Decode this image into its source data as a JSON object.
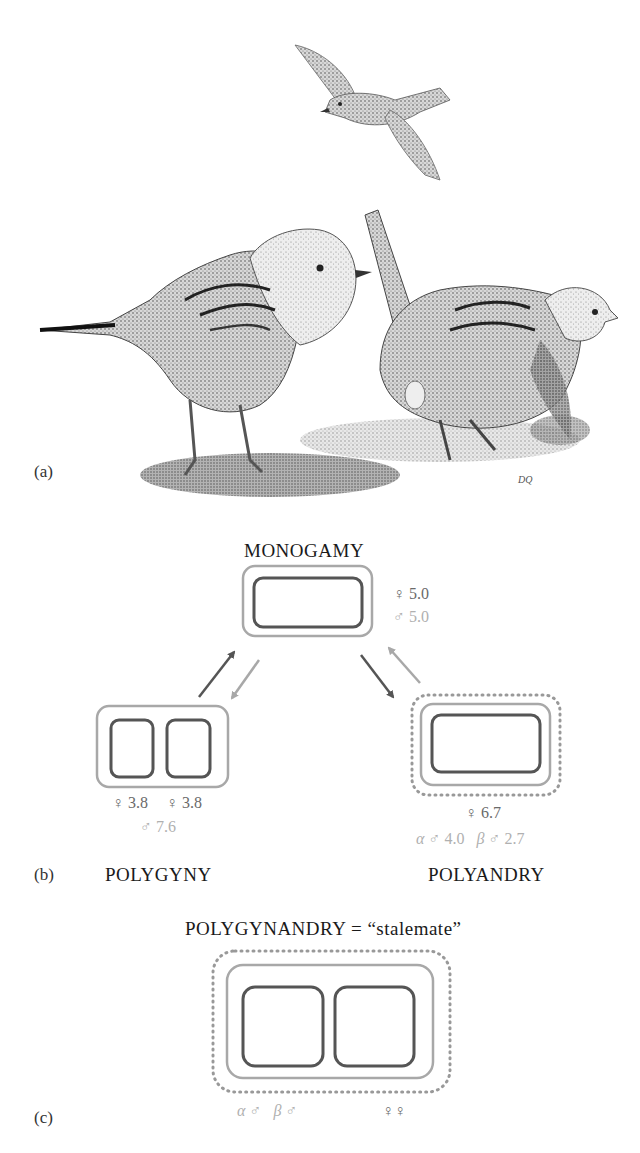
{
  "panels": {
    "a": {
      "label": "(a)",
      "illustration": "three-dunnocks-stipple-drawing",
      "artist_mark": "DQ"
    },
    "b": {
      "label": "(b)",
      "monogamy": {
        "title": "MONOGAMY",
        "female": "♀ 5.0",
        "male": "♂ 5.0"
      },
      "polygyny": {
        "title": "POLYGYNY",
        "female_1": "♀ 3.8",
        "female_2": "♀ 3.8",
        "male": "♂ 7.6"
      },
      "polyandry": {
        "title": "POLYANDRY",
        "female": "♀ 6.7",
        "alpha_symbol": "α",
        "alpha_male": "♂ 4.0",
        "beta_symbol": "β",
        "beta_male": "♂ 2.7"
      }
    },
    "c": {
      "label": "(c)",
      "title": "POLYGYNANDRY = “stalemate”",
      "alpha_symbol": "α",
      "alpha_male": "♂",
      "beta_symbol": "β",
      "beta_male": "♂",
      "females": "♀♀"
    }
  },
  "colors": {
    "female_territory": "#555555",
    "male_territory": "#a8a8a8",
    "beta_male_dotted": "#999999",
    "dark_arrow": "#555555",
    "light_arrow": "#a8a8a8"
  }
}
